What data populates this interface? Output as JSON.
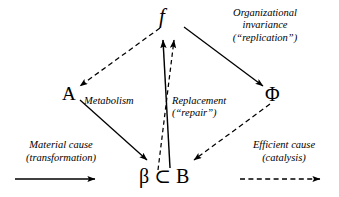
{
  "diagram": {
    "background": "#ffffff",
    "stroke_color": "#000000",
    "nodes": [
      {
        "id": "f",
        "label": "f",
        "style": "italic",
        "x": 169,
        "y": 22
      },
      {
        "id": "A",
        "label": "A",
        "style": "upright",
        "x": 70,
        "y": 97
      },
      {
        "id": "Phi",
        "label": "Φ",
        "style": "upright",
        "x": 275,
        "y": 97
      },
      {
        "id": "B",
        "label": "β ⊂ B",
        "style": "upright",
        "x": 168,
        "y": 180
      }
    ],
    "edges": [
      {
        "id": "f-to-A",
        "from": "f",
        "to": "A",
        "line": "dashed",
        "arrow": "end"
      },
      {
        "id": "f-to-Phi",
        "from": "f",
        "to": "Φ",
        "line": "solid",
        "arrow": "end"
      },
      {
        "id": "A-to-B",
        "from": "A",
        "to": "β ⊂ B",
        "line": "solid",
        "arrow": "end"
      },
      {
        "id": "Phi-to-B",
        "from": "Φ",
        "to": "β ⊂ B",
        "line": "dashed",
        "arrow": "end"
      },
      {
        "id": "B-to-f-solid",
        "from": "β ⊂ B",
        "to": "f",
        "line": "solid",
        "arrow": "end"
      },
      {
        "id": "B-to-f-dashed",
        "from": "β ⊂ B",
        "to": "f",
        "line": "dashed",
        "arrow": "end"
      }
    ],
    "labels": {
      "metabolism": "Metabolism",
      "replacement_line1": "Replacement",
      "replacement_line2": "(“repair”)",
      "organizational_line1": "Organizational",
      "organizational_line2": "invariance",
      "organizational_line3": "(“replication”)"
    },
    "legend": {
      "left": {
        "line1": "Material cause",
        "line2": "(transformation)",
        "arrow_style": "solid"
      },
      "right": {
        "line1": "Efficient cause",
        "line2": "(catalysis)",
        "arrow_style": "dashed"
      }
    }
  }
}
